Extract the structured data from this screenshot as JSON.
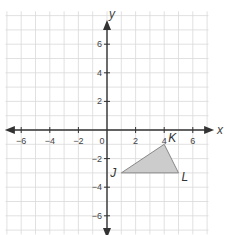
{
  "figure": {
    "type": "coordinate-plane",
    "axes": {
      "x_label": "x",
      "y_label": "y",
      "origin_label": "0",
      "x_range": [
        -7,
        7
      ],
      "y_range": [
        -7,
        7
      ],
      "x_ticks": [
        {
          "value": -6,
          "label": "-6"
        },
        {
          "value": -4,
          "label": "-4"
        },
        {
          "value": -2,
          "label": "-2"
        },
        {
          "value": 2,
          "label": "2"
        },
        {
          "value": 4,
          "label": "4"
        },
        {
          "value": 6,
          "label": "6"
        }
      ],
      "y_ticks": [
        {
          "value": 6,
          "label": "6"
        },
        {
          "value": 4,
          "label": "4"
        },
        {
          "value": 2,
          "label": "2"
        },
        {
          "value": -2,
          "label": "-2"
        },
        {
          "value": -4,
          "label": "-4"
        },
        {
          "value": -6,
          "label": "-6"
        }
      ]
    },
    "triangle": {
      "fill": "#cccccc",
      "stroke": "#888888",
      "vertices": [
        {
          "label": "J",
          "x": 1,
          "y": -3
        },
        {
          "label": "K",
          "x": 4,
          "y": -1
        },
        {
          "label": "L",
          "x": 5,
          "y": -3
        }
      ]
    },
    "colors": {
      "grid": "#d9d9d9",
      "axis": "#333333",
      "text": "#444444"
    }
  }
}
